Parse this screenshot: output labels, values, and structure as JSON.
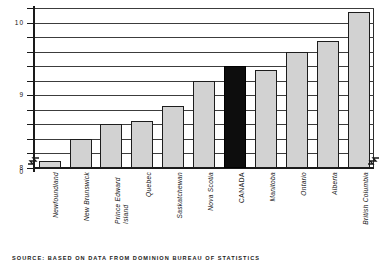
{
  "chart_data": {
    "type": "bar",
    "title": "",
    "subtitle": "",
    "xlabel": "",
    "ylabel": "",
    "ylim": [
      8.0,
      10.2
    ],
    "grid": true,
    "gridline_step": 0.2,
    "axis_break": true,
    "axis_break_label": "0",
    "legend": "none",
    "categories": [
      "Newfoundland",
      "New Brunswick",
      "Prince Edward Island",
      "Quebec",
      "Saskatchewan",
      "Nova Scotia",
      "CANADA",
      "Manitoba",
      "Ontario",
      "Alberta",
      "British Columbia"
    ],
    "values": [
      8.1,
      8.4,
      8.6,
      8.65,
      8.85,
      9.2,
      9.4,
      9.35,
      9.6,
      9.75,
      10.15
    ],
    "highlight_index": 6,
    "ytick_labels": [
      "10",
      "9",
      "8",
      "0"
    ],
    "ytick_values": [
      10,
      9,
      8,
      0
    ],
    "colors": {
      "bar_fill": "#d2d2d2",
      "bar_stroke": "#1d1d1d",
      "highlight_fill": "#0d0d0d",
      "gridline": "#3c3c3c",
      "axis": "#1a1a1a",
      "text": "#141414",
      "background": "#ffffff"
    }
  },
  "source": {
    "note": "SOURCE: BASED ON DATA FROM DOMINION BUREAU OF STATISTICS"
  }
}
